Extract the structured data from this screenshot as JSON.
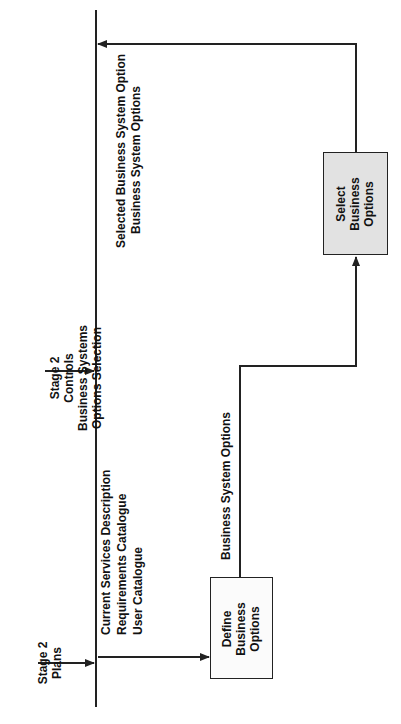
{
  "diagram": {
    "inputs": {
      "plans": {
        "lines": [
          "Stage 2",
          "Plans"
        ]
      },
      "controls": {
        "lines": [
          "Stage 2",
          "Controls",
          "Business Systems",
          "Options Selection"
        ]
      }
    },
    "flows": {
      "to_define": {
        "lines": [
          "Current Services Description",
          "Requirements Catalogue",
          "User Catalogue"
        ]
      },
      "define_to_select": {
        "label": "Business System Options"
      },
      "select_output": {
        "lines": [
          "Selected Business System Option",
          "Business System Options"
        ]
      }
    },
    "processes": {
      "define": {
        "lines": [
          "Define",
          "Business",
          "Options"
        ]
      },
      "select": {
        "lines": [
          "Select",
          "Business",
          "Options"
        ]
      }
    },
    "colors": {
      "line": "#222222",
      "define_fill": "#fbfbfb",
      "select_fill": "#e2e2e2"
    }
  }
}
